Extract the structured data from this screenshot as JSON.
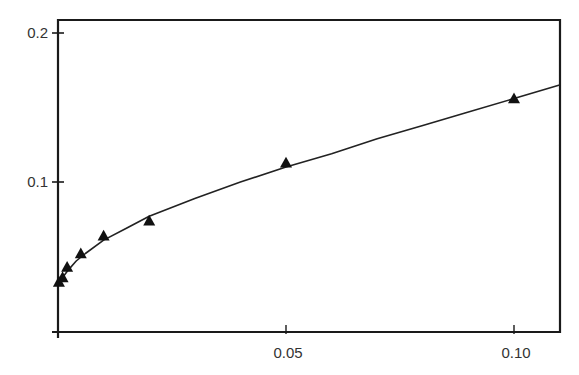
{
  "chart_data": {
    "type": "scatter",
    "title": "",
    "xlabel": "",
    "ylabel": "",
    "xlim": [
      0,
      0.11
    ],
    "ylim": [
      0,
      0.21
    ],
    "grid": false,
    "legend": null,
    "x_ticks": [
      {
        "value": 0.05,
        "label": "0.05"
      },
      {
        "value": 0.1,
        "label": "0.10"
      }
    ],
    "y_ticks": [
      {
        "value": 0.1,
        "label": "0.1"
      },
      {
        "value": 0.2,
        "label": "0.2"
      }
    ],
    "series": [
      {
        "name": "data",
        "marker": "triangle",
        "color": "#111111",
        "x": [
          0.0002,
          0.001,
          0.002,
          0.005,
          0.01,
          0.02,
          0.05,
          0.1
        ],
        "y": [
          0.033,
          0.036,
          0.043,
          0.052,
          0.064,
          0.074,
          0.113,
          0.156
        ]
      },
      {
        "name": "fit",
        "type": "line",
        "color": "#222222",
        "x": [
          0.0,
          0.001,
          0.002,
          0.004,
          0.006,
          0.01,
          0.015,
          0.02,
          0.03,
          0.04,
          0.05,
          0.06,
          0.07,
          0.08,
          0.09,
          0.1,
          0.11
        ],
        "y": [
          0.03,
          0.036,
          0.04,
          0.047,
          0.052,
          0.061,
          0.069,
          0.077,
          0.089,
          0.1,
          0.11,
          0.119,
          0.129,
          0.138,
          0.147,
          0.156,
          0.165
        ]
      }
    ]
  }
}
